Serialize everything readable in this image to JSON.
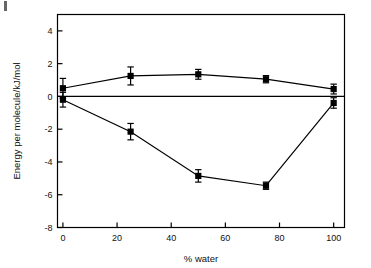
{
  "figure": {
    "corner_mark_name": "figure-corner-mark"
  },
  "chart_data": {
    "type": "line",
    "title": "",
    "xlabel": "% water",
    "ylabel": "Energy per molecule/kJ/mol",
    "x": [
      0,
      25,
      50,
      75,
      100
    ],
    "xlim": [
      -2,
      104
    ],
    "ylim": [
      -8,
      5
    ],
    "xticks": [
      0,
      20,
      40,
      60,
      80,
      100
    ],
    "xtick_labels": [
      "0",
      "20",
      "40",
      "60",
      "80",
      "100"
    ],
    "yticks": [
      4,
      2,
      0,
      -2,
      -4,
      -6,
      -8
    ],
    "ytick_labels": [
      "4",
      "2",
      "0",
      "-2",
      "-4",
      "-6",
      "-8"
    ],
    "grid": false,
    "legend": "none",
    "zero_reference_line": 0,
    "marker": "filled-square",
    "line_color": "#000000",
    "marker_color": "#000000",
    "series": [
      {
        "name": "upper-series",
        "values": [
          0.5,
          1.25,
          1.35,
          1.05,
          0.45
        ],
        "errors": [
          0.6,
          0.55,
          0.3,
          0.22,
          0.3
        ]
      },
      {
        "name": "lower-series",
        "values": [
          -0.2,
          -2.15,
          -4.85,
          -5.45,
          -0.4
        ],
        "errors": [
          0.45,
          0.5,
          0.38,
          0.22,
          0.32
        ]
      }
    ],
    "annotations": []
  }
}
